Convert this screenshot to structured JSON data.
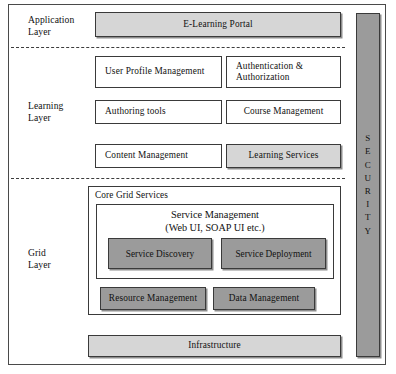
{
  "diagram": {
    "colors": {
      "light_box_fill": "#d6d6d6",
      "dark_box_fill": "#9b9b9b",
      "white_box_fill": "#ffffff",
      "border": "#3a3a3a",
      "background": "#ffffff"
    },
    "layers": [
      {
        "id": "application",
        "label_line1": "Application",
        "label_line2": "Layer"
      },
      {
        "id": "learning",
        "label_line1": "Learning",
        "label_line2": "Layer"
      },
      {
        "id": "grid",
        "label_line1": "Grid",
        "label_line2": "Layer"
      }
    ],
    "application_layer": {
      "boxes": [
        {
          "name": "e-learning-portal",
          "label": "E-Learning Portal",
          "fill": "light",
          "align": "center"
        }
      ]
    },
    "learning_layer": {
      "boxes": [
        {
          "name": "user-profile-management",
          "label": "User Profile Management",
          "fill": "white",
          "align": "left"
        },
        {
          "name": "authentication-authorization",
          "label": "Authentication & Authorization",
          "fill": "white",
          "align": "left"
        },
        {
          "name": "authoring-tools",
          "label": "Authoring tools",
          "fill": "white",
          "align": "left"
        },
        {
          "name": "course-management",
          "label": "Course Management",
          "fill": "white",
          "align": "center"
        },
        {
          "name": "content-management",
          "label": "Content Management",
          "fill": "white",
          "align": "left"
        },
        {
          "name": "learning-services",
          "label": "Learning Services",
          "fill": "light",
          "align": "center"
        }
      ]
    },
    "grid_layer": {
      "core_grid_services": {
        "title": "Core Grid Services",
        "service_management": {
          "title": "Service Management",
          "subtitle": "(Web UI, SOAP UI etc.)",
          "sub_boxes": [
            {
              "name": "service-discovery",
              "label": "Service Discovery",
              "fill": "dark"
            },
            {
              "name": "service-deployment",
              "label": "Service Deployment",
              "fill": "dark"
            }
          ]
        },
        "boxes": [
          {
            "name": "resource-management",
            "label": "Resource Management",
            "fill": "dark"
          },
          {
            "name": "data-management",
            "label": "Data Management",
            "fill": "dark"
          }
        ]
      }
    },
    "infrastructure": {
      "name": "infrastructure",
      "label": "Infrastructure",
      "fill": "light"
    },
    "security_column": {
      "label": "SECURITY",
      "letters": [
        "S",
        "E",
        "C",
        "U",
        "R",
        "I",
        "T",
        "Y"
      ],
      "fill": "dark"
    }
  }
}
